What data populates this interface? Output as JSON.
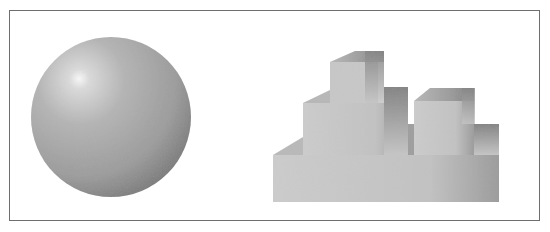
{
  "figure": {
    "frame_color": "#6e6e6e",
    "background": "#ffffff",
    "sphere": {
      "cx": 111,
      "cy": 117,
      "r": 80,
      "highlight": {
        "cx": 87,
        "cy": 96
      },
      "colors": {
        "highlight": "#f4f4f4",
        "mid": "#a9a9a9",
        "shadow": "#6f6f6f"
      }
    },
    "blocks": {
      "front_color": "#c9c9c9",
      "top_color": "#8e8e8e",
      "side_color": "#7a7a7a",
      "shadow_color": "#9a9a9a"
    }
  }
}
